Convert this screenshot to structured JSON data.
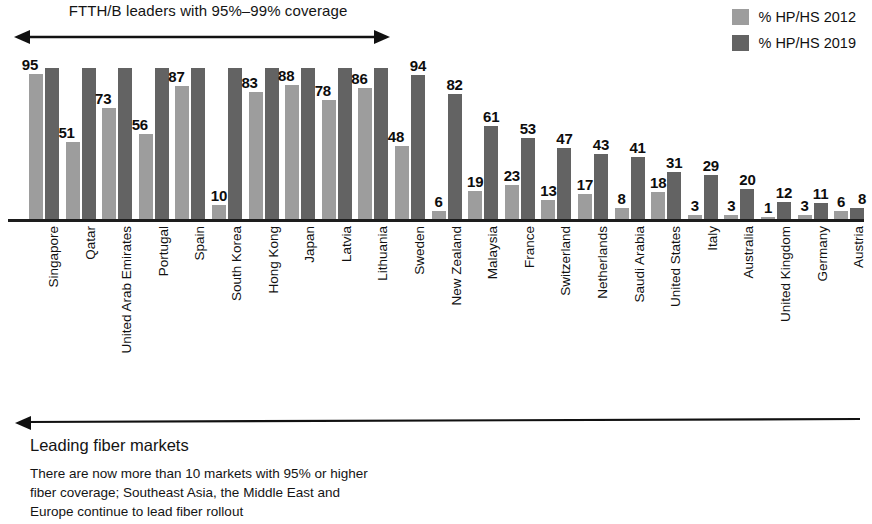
{
  "annotations": {
    "top_label": "FTTH/B leaders with 95%–99% coverage",
    "top_arrow_icon": "double-headed-arrow-icon",
    "bottom_arrow_icon": "left-arrow-icon",
    "bottom_title": "Leading fiber markets",
    "bottom_body_line1": "There are now more than 10 markets with 95% or higher",
    "bottom_body_line2": "fiber coverage; Southeast Asia, the Middle East and",
    "bottom_body_line3": "Europe continue to lead fiber rollout"
  },
  "legend": {
    "position": "top-right",
    "items": [
      {
        "label": "% HP/HS 2012",
        "color": "#9d9d9d",
        "swatch_icon": "legend-swatch-icon"
      },
      {
        "label": "% HP/HS 2019",
        "color": "#636363",
        "swatch_icon": "legend-swatch-icon"
      }
    ]
  },
  "chart_data": {
    "type": "bar",
    "title": "",
    "subtitle": "",
    "xlabel": "",
    "ylabel": "",
    "ylim": [
      0,
      100
    ],
    "grid": false,
    "legend_position": "top-right",
    "orientation": "vertical",
    "grouping": "grouped",
    "categories": [
      "Singapore",
      "Qatar",
      "United Arab Emirates",
      "Portugal",
      "Spain",
      "South Korea",
      "Hong Kong",
      "Japan",
      "Latvia",
      "Lithuania",
      "Sweden",
      "New Zealand",
      "Malaysia",
      "France",
      "Switzerland",
      "Netherlands",
      "Saudi Arabia",
      "United States",
      "Italy",
      "Australia",
      "United Kingdom",
      "Germany",
      "Austria"
    ],
    "series": [
      {
        "name": "% HP/HS 2012",
        "color": "#9d9d9d",
        "values": [
          95,
          51,
          73,
          56,
          87,
          10,
          83,
          88,
          78,
          86,
          48,
          6,
          19,
          23,
          13,
          17,
          8,
          18,
          3,
          3,
          1,
          3,
          6
        ]
      },
      {
        "name": "% HP/HS 2019",
        "color": "#636363",
        "values": [
          99,
          99,
          99,
          99,
          99,
          99,
          99,
          99,
          99,
          99,
          94,
          82,
          61,
          53,
          47,
          43,
          41,
          31,
          29,
          20,
          12,
          11,
          8
        ]
      }
    ],
    "labeled_series": "% HP/HS 2012 for leaders; % HP/HS 2019 for followers",
    "visible_data_labels": [
      {
        "category": "Singapore",
        "label": "95",
        "series": "% HP/HS 2012"
      },
      {
        "category": "Qatar",
        "label": "51",
        "series": "% HP/HS 2012"
      },
      {
        "category": "United Arab Emirates",
        "label": "73",
        "series": "% HP/HS 2012"
      },
      {
        "category": "Portugal",
        "label": "56",
        "series": "% HP/HS 2012"
      },
      {
        "category": "Spain",
        "label": "87",
        "series": "% HP/HS 2012"
      },
      {
        "category": "South Korea",
        "label": "10",
        "series": "% HP/HS 2012"
      },
      {
        "category": "Hong Kong",
        "label": "83",
        "series": "% HP/HS 2012"
      },
      {
        "category": "Japan",
        "label": "88",
        "series": "% HP/HS 2012"
      },
      {
        "category": "Latvia",
        "label": "78",
        "series": "% HP/HS 2012"
      },
      {
        "category": "Lithuania",
        "label": "86",
        "series": "% HP/HS 2012"
      },
      {
        "category": "Sweden",
        "label": "48",
        "series": "% HP/HS 2012"
      },
      {
        "category": "Sweden",
        "label": "94",
        "series": "% HP/HS 2019"
      },
      {
        "category": "New Zealand",
        "label": "6",
        "series": "% HP/HS 2012"
      },
      {
        "category": "New Zealand",
        "label": "82",
        "series": "% HP/HS 2019"
      },
      {
        "category": "Malaysia",
        "label": "19",
        "series": "% HP/HS 2012"
      },
      {
        "category": "Malaysia",
        "label": "61",
        "series": "% HP/HS 2019"
      },
      {
        "category": "France",
        "label": "23",
        "series": "% HP/HS 2012"
      },
      {
        "category": "France",
        "label": "53",
        "series": "% HP/HS 2019"
      },
      {
        "category": "Switzerland",
        "label": "13",
        "series": "% HP/HS 2012"
      },
      {
        "category": "Switzerland",
        "label": "47",
        "series": "% HP/HS 2019"
      },
      {
        "category": "Netherlands",
        "label": "17",
        "series": "% HP/HS 2012"
      },
      {
        "category": "Netherlands",
        "label": "43",
        "series": "% HP/HS 2019"
      },
      {
        "category": "Saudi Arabia",
        "label": "8",
        "series": "% HP/HS 2012"
      },
      {
        "category": "Saudi Arabia",
        "label": "41",
        "series": "% HP/HS 2019"
      },
      {
        "category": "United States",
        "label": "18",
        "series": "% HP/HS 2012"
      },
      {
        "category": "United States",
        "label": "31",
        "series": "% HP/HS 2019"
      },
      {
        "category": "Italy",
        "label": "3",
        "series": "% HP/HS 2012"
      },
      {
        "category": "Italy",
        "label": "29",
        "series": "% HP/HS 2019"
      },
      {
        "category": "Australia",
        "label": "3",
        "series": "% HP/HS 2012"
      },
      {
        "category": "Australia",
        "label": "20",
        "series": "% HP/HS 2019"
      },
      {
        "category": "United Kingdom",
        "label": "1",
        "series": "% HP/HS 2012"
      },
      {
        "category": "United Kingdom",
        "label": "12",
        "series": "% HP/HS 2019"
      },
      {
        "category": "Germany",
        "label": "3",
        "series": "% HP/HS 2012"
      },
      {
        "category": "Germany",
        "label": "11",
        "series": "% HP/HS 2019"
      },
      {
        "category": "Austria",
        "label": "6",
        "series": "% HP/HS 2012"
      },
      {
        "category": "Austria",
        "label": "8",
        "series": "% HP/HS 2019"
      }
    ]
  },
  "layout": {
    "bar_label_mode": [
      "light",
      "light",
      "light",
      "light",
      "light",
      "light",
      "light",
      "light",
      "light",
      "light",
      "both",
      "both",
      "both",
      "both",
      "both",
      "both",
      "both",
      "both",
      "both",
      "both",
      "both",
      "both",
      "both"
    ]
  }
}
